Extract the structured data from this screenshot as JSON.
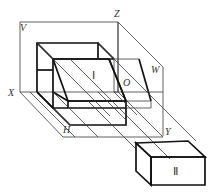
{
  "diagram": {
    "title": "",
    "planes": [
      {
        "name": "V-plane",
        "label": "V"
      },
      {
        "name": "W-plane",
        "label": "W"
      },
      {
        "name": "H-plane",
        "label": "H"
      }
    ],
    "axes": {
      "x": "X",
      "y": "Y",
      "z": "Z",
      "origin": "O"
    },
    "objects": [
      {
        "name": "object-1",
        "label": "Ⅰ"
      },
      {
        "name": "object-2",
        "label": "Ⅱ"
      }
    ],
    "colors": {
      "line": "#111111",
      "thin_line": "#3a3a3a",
      "background": "#ffffff"
    }
  }
}
